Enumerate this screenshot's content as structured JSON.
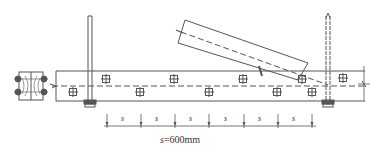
{
  "diagram": {
    "type": "structural-elevation",
    "stroke_color": "#555555",
    "dimension": {
      "segment_label": "s",
      "segment_count": 6,
      "caption_var": "s",
      "caption_value": "=600mm"
    },
    "bolts_top_row_count": 5,
    "bolts_bottom_row_count": 5
  }
}
